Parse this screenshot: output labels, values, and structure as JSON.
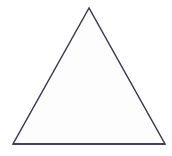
{
  "canvas": {
    "width": 172,
    "height": 156,
    "background_color": "#ffffff"
  },
  "figure": {
    "name": "triangle",
    "kind": "isosceles-triangle-outline",
    "stroke_color": "#3b3b52",
    "stroke_width": 1.5,
    "fill_color": "#fdfdfd",
    "baseline_stroke_color": "#33334d",
    "vertices": {
      "apex": {
        "x": 89,
        "y": 8
      },
      "bottom_left": {
        "x": 13,
        "y": 144
      },
      "bottom_right": {
        "x": 165,
        "y": 144
      }
    },
    "points_string": "89,8 13,144 165,144",
    "measurements": {
      "base_width": 152,
      "height": 136,
      "mid_height_left_x": 51,
      "mid_height_right_x": 128
    }
  },
  "labels": {
    "apex_label": "",
    "bottom_left_label": "",
    "bottom_right_label": "",
    "caption": ""
  }
}
